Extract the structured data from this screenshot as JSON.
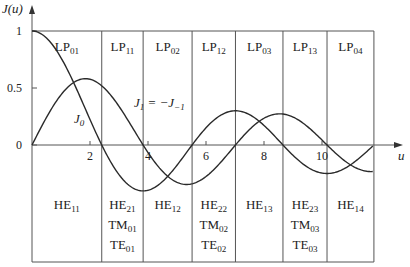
{
  "chart_data": {
    "type": "line",
    "title": "",
    "xlabel": "u",
    "ylabel": "J(u)",
    "xlim": [
      0,
      11.79
    ],
    "ylim": [
      -0.4,
      1
    ],
    "x_ticks": [
      2,
      4,
      6,
      8,
      10
    ],
    "x_tick_labels": [
      "2",
      "4",
      "6",
      "8",
      "10"
    ],
    "y_ticks": [
      0,
      0.5,
      1
    ],
    "y_tick_labels": [
      "0",
      "0.5",
      "1"
    ],
    "grid": false,
    "series": [
      {
        "name": "J0",
        "label": "J",
        "sub": "0",
        "x": [
          0,
          0.5,
          1,
          1.5,
          2,
          2.405,
          3,
          3.5,
          3.832,
          4,
          4.5,
          5,
          5.52,
          6,
          6.5,
          7,
          7.5,
          8,
          8.654,
          9,
          9.5,
          10,
          10.5,
          11,
          11.79
        ],
        "values": [
          1,
          0.938,
          0.765,
          0.512,
          0.224,
          0,
          -0.26,
          -0.38,
          -0.403,
          -0.397,
          -0.321,
          -0.178,
          0,
          0.151,
          0.26,
          0.3,
          0.266,
          0.172,
          0,
          -0.09,
          -0.194,
          -0.246,
          -0.237,
          -0.171,
          0
        ]
      },
      {
        "name": "J1 = -J-1",
        "label": "J",
        "sub": "1",
        "eq": "= −J",
        "eq_sub": "−1",
        "x": [
          0,
          0.5,
          1,
          1.5,
          1.841,
          2,
          2.405,
          3,
          3.5,
          3.832,
          4,
          4.5,
          5,
          5.331,
          5.52,
          6,
          6.5,
          7,
          7.016,
          7.5,
          8,
          8.536,
          9,
          9.5,
          10,
          10.173,
          10.5,
          11,
          11.79
        ],
        "values": [
          0,
          0.242,
          0.44,
          0.558,
          0.582,
          0.577,
          0.519,
          0.339,
          0.137,
          0,
          -0.066,
          -0.231,
          -0.328,
          -0.346,
          -0.341,
          -0.277,
          -0.154,
          -0.005,
          0,
          0.135,
          0.235,
          0.273,
          0.245,
          0.161,
          0.043,
          0,
          -0.079,
          -0.177,
          -0.271
        ]
      }
    ],
    "boundaries": [
      2.405,
      3.832,
      5.52,
      7.016,
      8.654,
      10.173,
      11.79
    ],
    "lp_modes": [
      {
        "base": "LP",
        "sub": "01"
      },
      {
        "base": "LP",
        "sub": "11"
      },
      {
        "base": "LP",
        "sub": "02"
      },
      {
        "base": "LP",
        "sub": "12"
      },
      {
        "base": "LP",
        "sub": "03"
      },
      {
        "base": "LP",
        "sub": "13"
      },
      {
        "base": "LP",
        "sub": "04"
      }
    ],
    "vector_modes": [
      [
        {
          "base": "HE",
          "sub": "11"
        }
      ],
      [
        {
          "base": "HE",
          "sub": "21"
        },
        {
          "base": "TM",
          "sub": "01"
        },
        {
          "base": "TE",
          "sub": "01"
        }
      ],
      [
        {
          "base": "HE",
          "sub": "12"
        }
      ],
      [
        {
          "base": "HE",
          "sub": "22"
        },
        {
          "base": "TM",
          "sub": "02"
        },
        {
          "base": "TE",
          "sub": "02"
        }
      ],
      [
        {
          "base": "HE",
          "sub": "13"
        }
      ],
      [
        {
          "base": "HE",
          "sub": "23"
        },
        {
          "base": "TM",
          "sub": "03"
        },
        {
          "base": "TE",
          "sub": "03"
        }
      ],
      [
        {
          "base": "HE",
          "sub": "14"
        }
      ]
    ]
  },
  "axis": {
    "ylabel_main": "J(u)",
    "xlabel": "u"
  },
  "colors": {
    "line": "#2a2a2a",
    "grid": "#555555",
    "bg": "#ffffff"
  }
}
